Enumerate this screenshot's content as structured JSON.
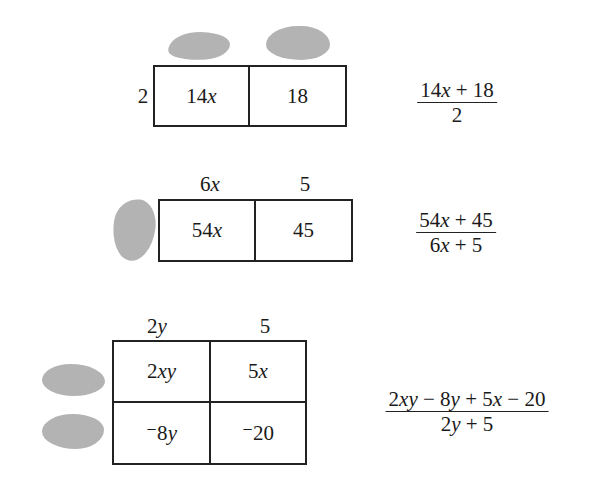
{
  "problems": [
    {
      "id": "a",
      "left_label": "2",
      "top_labels": [
        "",
        ""
      ],
      "top_labels_hidden": true,
      "cells": [
        [
          "14x",
          "18"
        ]
      ],
      "fraction": {
        "numerator": "14x + 18",
        "denominator": "2"
      }
    },
    {
      "id": "b",
      "left_label": "",
      "left_label_hidden": true,
      "top_labels": [
        "6x",
        "5"
      ],
      "cells": [
        [
          "54x",
          "45"
        ]
      ],
      "fraction": {
        "numerator": "54x + 45",
        "denominator": "6x + 5"
      }
    },
    {
      "id": "c",
      "left_labels": [
        "",
        ""
      ],
      "left_labels_hidden": true,
      "top_labels": [
        "2y",
        "5"
      ],
      "cells": [
        [
          "2xy",
          "5x"
        ],
        [
          "⁻8y",
          "⁻20"
        ]
      ],
      "fraction": {
        "numerator": "2xy − 8y + 5x − 20",
        "denominator": "2y + 5"
      }
    }
  ],
  "colors": {
    "line": "#222222",
    "hidden_blob": "#b3b3b3",
    "background": "#ffffff"
  }
}
